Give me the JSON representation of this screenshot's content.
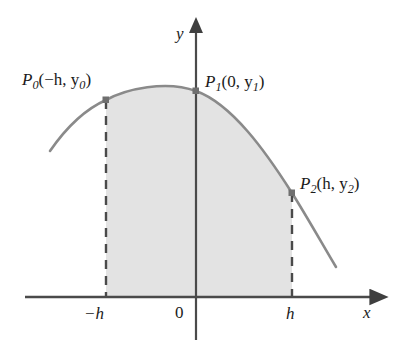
{
  "figure": {
    "kind": "parabola-through-three-points",
    "colors": {
      "curve": "#8a8a8a",
      "axis": "#4a4a4a",
      "dashed": "#4a4a4a",
      "shade_fill": "#e3e3e3",
      "point_marker": "#6f6f6f",
      "text": "#1b1b1b",
      "background": "#ffffff"
    },
    "axes": {
      "x_label": "x",
      "y_label": "y",
      "origin_label": "0",
      "x_axis_y_px": 297,
      "y_axis_x_px": 196,
      "x_axis_start_px": 25,
      "x_axis_arrow_tip_px": 379,
      "y_axis_arrow_tip_px": 25,
      "y_axis_bottom_px": 340
    },
    "ticks": [
      {
        "name": "neg-h",
        "label": "−h",
        "x_px": 106
      },
      {
        "name": "zero",
        "label": "0",
        "x_px": 196
      },
      {
        "name": "pos-h",
        "label": "h",
        "x_px": 292
      }
    ],
    "points": [
      {
        "name": "P0",
        "label_base": "P",
        "label_sub": "0",
        "label_args": "(−h, y",
        "label_arg_sub": "0",
        "label_close": ")",
        "full_label": "P₀(−h, y₀)",
        "x_px": 106,
        "y_px": 100
      },
      {
        "name": "P1",
        "label_base": "P",
        "label_sub": "1",
        "label_args": "(0, y",
        "label_arg_sub": "1",
        "label_close": ")",
        "full_label": "P₁(0, y₁)",
        "x_px": 196,
        "y_px": 91
      },
      {
        "name": "P2",
        "label_base": "P",
        "label_sub": "2",
        "label_args": "(h, y",
        "label_arg_sub": "2",
        "label_close": ")",
        "full_label": "P₂(h, y₂)",
        "x_px": 292,
        "y_px": 193
      }
    ],
    "dashed_verticals": [
      {
        "name": "dashed-left",
        "x_px": 106,
        "y_top_px": 100,
        "y_bottom_px": 297
      },
      {
        "name": "dashed-right",
        "x_px": 292,
        "y_top_px": 193,
        "y_bottom_px": 297
      }
    ],
    "curve": {
      "vertex_x_px": 146,
      "vertex_y_px": 83,
      "left_end_x_px": 50,
      "left_end_y_px": 151,
      "right_end_x_px": 336,
      "right_end_y_px": 267
    }
  }
}
